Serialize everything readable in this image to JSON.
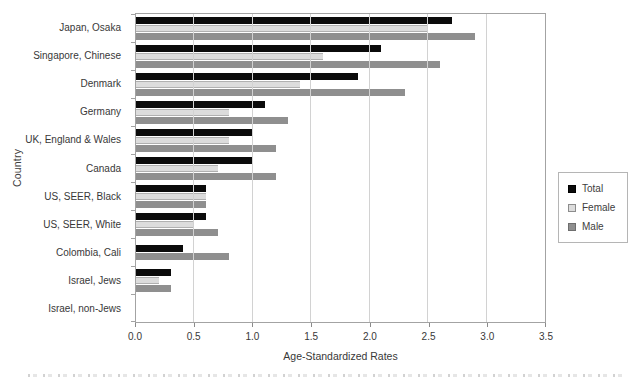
{
  "chart_data": {
    "type": "bar",
    "orientation": "horizontal",
    "xlabel": "Age-Standardized Rates",
    "ylabel": "Country",
    "xlim": [
      0,
      3.5
    ],
    "xtick_step": 0.5,
    "xticks": [
      "0.0",
      "0.5",
      "1.0",
      "1.5",
      "2.0",
      "2.5",
      "3.0",
      "3.5"
    ],
    "grid": "vertical",
    "categories": [
      "Japan, Osaka",
      "Singapore, Chinese",
      "Denmark",
      "Germany",
      "UK, England & Wales",
      "Canada",
      "US, SEER, Black",
      "US, SEER, White",
      "Colombia, Cali",
      "Israel, Jews",
      "Israel, non-Jews"
    ],
    "series": [
      {
        "name": "Total",
        "color": "#0b0b0b",
        "swatch_border": "#000000",
        "bar_border": "",
        "values": [
          2.7,
          2.1,
          1.9,
          1.1,
          1.0,
          1.0,
          0.6,
          0.6,
          0.4,
          0.3,
          0
        ]
      },
      {
        "name": "Female",
        "color": "#dcdcdc",
        "swatch_border": "#8c8c8c",
        "bar_border": "#b0b0b0",
        "values": [
          2.5,
          1.6,
          1.4,
          0.8,
          0.8,
          0.7,
          0.6,
          0.5,
          0,
          0.2,
          0
        ]
      },
      {
        "name": "Male",
        "color": "#8f8f8f",
        "swatch_border": "#6e6e6e",
        "bar_border": "",
        "values": [
          2.9,
          2.6,
          2.3,
          1.3,
          1.2,
          1.2,
          0.6,
          0.7,
          0.8,
          0.3,
          0
        ]
      }
    ],
    "legend": {
      "position": "right",
      "entries": [
        "Total",
        "Female",
        "Male"
      ]
    }
  },
  "colors": {
    "background": "#ffffff",
    "plot_border": "#a3a3a3",
    "gridline": "#d2d2d2",
    "text": "#383838"
  }
}
